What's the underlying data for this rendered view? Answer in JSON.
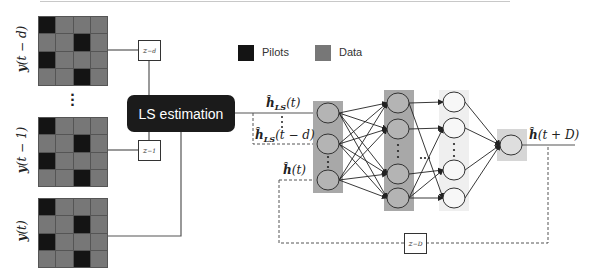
{
  "diagram": {
    "grids": [
      {
        "id": "y_t_minus_d",
        "label": "y(t − d)",
        "pilot_cells": [
          [
            0,
            0
          ],
          [
            1,
            2
          ],
          [
            2,
            0
          ],
          [
            3,
            2
          ]
        ]
      },
      {
        "id": "y_t_minus_1",
        "label": "y(t − 1)",
        "pilot_cells": [
          [
            0,
            0
          ],
          [
            1,
            2
          ],
          [
            2,
            0
          ],
          [
            3,
            2
          ]
        ]
      },
      {
        "id": "y_t",
        "label": "y(t)",
        "pilot_cells": [
          [
            0,
            0
          ],
          [
            1,
            2
          ],
          [
            2,
            0
          ],
          [
            3,
            2
          ]
        ]
      }
    ],
    "vertical_ellipsis": "⋮",
    "delays": {
      "z_minus_d": {
        "base": "z",
        "exp": "−d"
      },
      "z_minus_1": {
        "base": "z",
        "exp": "−1"
      },
      "z_minus_D": {
        "base": "z",
        "exp": "−D"
      }
    },
    "ls_block": {
      "label": "LS estimation"
    },
    "legend": [
      {
        "label": "Pilots",
        "color": "#141414"
      },
      {
        "label": "Data",
        "color": "#777777"
      }
    ],
    "signals": {
      "h_ls_t": {
        "base": "ĥ",
        "sub": "LS",
        "arg": "(t)"
      },
      "h_ls_t_minus_d": {
        "base": "ĥ",
        "sub": "LS",
        "arg": "(t − d)"
      },
      "h_t": {
        "base": "ĥ",
        "arg": "(t)"
      },
      "h_t_plus_D": {
        "base": "ĥ",
        "arg": "(t + D)"
      }
    },
    "network": {
      "layers": [
        {
          "name": "input",
          "nodes": 3,
          "shade": "#a8a8a8"
        },
        {
          "name": "hidden-1",
          "nodes": 4,
          "shade": "#a8a8a8"
        },
        {
          "name": "hidden-n",
          "nodes": 4,
          "shade": "#efefef"
        },
        {
          "name": "output",
          "nodes": 1,
          "shade": "#d6d6d6"
        }
      ],
      "between_hidden_ellipsis": "⋯"
    },
    "colors": {
      "pilot": "#141414",
      "data": "#777777",
      "ls_block": "#1b1b1b",
      "layer_dark": "#a8a8a8",
      "layer_light": "#efefef",
      "output_box": "#d6d6d6"
    }
  }
}
